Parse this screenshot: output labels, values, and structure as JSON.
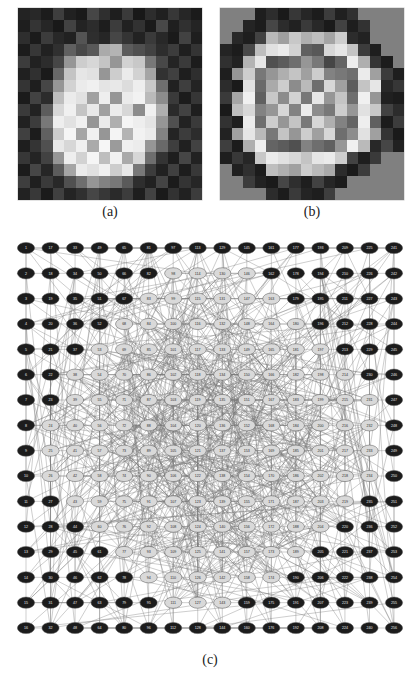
{
  "figure": {
    "panel_a": {
      "caption": "(a)",
      "description": "grayscale pixel map of a solid disk"
    },
    "panel_b": {
      "caption": "(b)",
      "description": "grayscale pixel map of an annulus / ring"
    },
    "panel_c": {
      "caption": "(c)",
      "description": "network graph of 256 nodes on a 16x16 lattice with highlighted boundary community"
    }
  },
  "colors": {
    "background": "#ffffff",
    "node_light_fill": "#d9d9d9",
    "node_dark_fill": "#1c1c1c",
    "node_stroke": "#555555",
    "edge": "#7a7a7a",
    "label_light": "#2a2a2a",
    "label_dark": "#e8e8e8",
    "heatmap_border": "#808080"
  },
  "chart_data": [
    {
      "type": "heatmap",
      "title": "(a)",
      "rows": 16,
      "cols": 16,
      "vmin": 0,
      "vmax": 255,
      "colormap": "gray",
      "xlabel": "",
      "ylabel": "",
      "grid": false,
      "values": [
        [
          35,
          40,
          28,
          62,
          33,
          26,
          70,
          47,
          30,
          58,
          24,
          45,
          32,
          55,
          38,
          27
        ],
        [
          30,
          52,
          38,
          25,
          66,
          35,
          44,
          29,
          60,
          33,
          50,
          26,
          72,
          31,
          48,
          36
        ],
        [
          46,
          27,
          60,
          40,
          33,
          84,
          46,
          38,
          70,
          52,
          34,
          58,
          40,
          26,
          66,
          30
        ],
        [
          28,
          55,
          33,
          48,
          96,
          72,
          88,
          170,
          180,
          92,
          80,
          66,
          45,
          60,
          31,
          52
        ],
        [
          60,
          33,
          44,
          70,
          150,
          205,
          215,
          196,
          150,
          210,
          200,
          120,
          72,
          36,
          58,
          28
        ],
        [
          32,
          48,
          26,
          104,
          196,
          230,
          225,
          150,
          205,
          235,
          210,
          165,
          50,
          64,
          30,
          46
        ],
        [
          52,
          30,
          70,
          150,
          210,
          235,
          240,
          228,
          232,
          220,
          238,
          200,
          110,
          33,
          62,
          35
        ],
        [
          27,
          66,
          44,
          190,
          235,
          225,
          160,
          238,
          150,
          235,
          242,
          186,
          140,
          58,
          28,
          54
        ],
        [
          58,
          34,
          92,
          215,
          240,
          196,
          232,
          160,
          236,
          215,
          140,
          240,
          175,
          42,
          66,
          30
        ],
        [
          33,
          60,
          120,
          238,
          225,
          240,
          150,
          235,
          175,
          245,
          238,
          228,
          150,
          80,
          34,
          58
        ],
        [
          64,
          28,
          96,
          205,
          245,
          165,
          240,
          150,
          244,
          180,
          242,
          235,
          130,
          36,
          60,
          44
        ],
        [
          30,
          52,
          80,
          232,
          215,
          240,
          170,
          246,
          155,
          240,
          236,
          150,
          105,
          62,
          32,
          66
        ],
        [
          55,
          36,
          66,
          150,
          238,
          210,
          245,
          190,
          242,
          170,
          215,
          110,
          52,
          30,
          70,
          34
        ],
        [
          28,
          70,
          38,
          92,
          165,
          235,
          225,
          240,
          205,
          232,
          120,
          60,
          33,
          64,
          29,
          56
        ],
        [
          62,
          31,
          58,
          40,
          80,
          110,
          150,
          130,
          120,
          90,
          46,
          33,
          68,
          27,
          52,
          38
        ],
        [
          34,
          56,
          27,
          64,
          36,
          48,
          70,
          55,
          42,
          60,
          30,
          66,
          26,
          50,
          33,
          60
        ]
      ]
    },
    {
      "type": "heatmap",
      "title": "(b)",
      "rows": 16,
      "cols": 16,
      "vmin": 0,
      "vmax": 255,
      "colormap": "gray",
      "xlabel": "",
      "ylabel": "",
      "grid": false,
      "values": [
        [
          128,
          128,
          128,
          30,
          45,
          26,
          55,
          38,
          28,
          60,
          32,
          48,
          128,
          128,
          128,
          128
        ],
        [
          128,
          128,
          36,
          28,
          70,
          44,
          33,
          58,
          40,
          26,
          66,
          30,
          50,
          128,
          128,
          128
        ],
        [
          128,
          40,
          30,
          66,
          185,
          160,
          200,
          175,
          190,
          165,
          205,
          44,
          34,
          128,
          128,
          128
        ],
        [
          36,
          28,
          72,
          190,
          225,
          235,
          210,
          96,
          88,
          215,
          230,
          196,
          60,
          30,
          128,
          128
        ],
        [
          48,
          34,
          180,
          230,
          80,
          92,
          110,
          150,
          120,
          70,
          100,
          238,
          175,
          52,
          28,
          128
        ],
        [
          30,
          150,
          205,
          120,
          150,
          175,
          196,
          160,
          205,
          130,
          120,
          110,
          235,
          160,
          60,
          30
        ],
        [
          44,
          26,
          225,
          106,
          170,
          205,
          140,
          186,
          110,
          215,
          160,
          92,
          196,
          230,
          40,
          55
        ],
        [
          58,
          165,
          240,
          96,
          200,
          140,
          210,
          120,
          230,
          150,
          196,
          110,
          240,
          150,
          32,
          28
        ],
        [
          26,
          190,
          215,
          130,
          150,
          215,
          130,
          235,
          140,
          120,
          205,
          150,
          225,
          200,
          66,
          44
        ],
        [
          50,
          30,
          235,
          110,
          205,
          150,
          196,
          120,
          215,
          175,
          130,
          100,
          238,
          96,
          28,
          60
        ],
        [
          34,
          160,
          230,
          186,
          120,
          196,
          150,
          205,
          160,
          215,
          110,
          140,
          225,
          160,
          52,
          26
        ],
        [
          62,
          28,
          175,
          238,
          100,
          92,
          80,
          130,
          110,
          96,
          150,
          240,
          186,
          40,
          70,
          33
        ],
        [
          30,
          56,
          38,
          200,
          235,
          225,
          215,
          196,
          230,
          235,
          205,
          66,
          30,
          58,
          128,
          128
        ],
        [
          128,
          32,
          48,
          28,
          190,
          175,
          160,
          205,
          186,
          170,
          44,
          26,
          60,
          128,
          128,
          128
        ],
        [
          128,
          128,
          60,
          34,
          26,
          70,
          46,
          30,
          66,
          38,
          28,
          128,
          128,
          128,
          128,
          128
        ],
        [
          128,
          128,
          128,
          128,
          44,
          28,
          58,
          36,
          30,
          62,
          128,
          128,
          128,
          128,
          128,
          128
        ]
      ]
    },
    {
      "type": "scatter",
      "title": "(c)",
      "layout": "16x16 lattice",
      "node_count": 256,
      "xlabel": "",
      "ylabel": "",
      "grid": false,
      "legend": [
        {
          "label": "boundary / ring community",
          "color": "#1c1c1c"
        },
        {
          "label": "interior community",
          "color": "#d9d9d9"
        }
      ],
      "dark_node_ids": [
        4,
        5,
        6,
        7,
        8,
        9,
        10,
        11,
        12,
        13,
        20,
        21,
        34,
        35,
        18,
        19,
        49,
        50,
        65,
        66,
        81,
        82,
        97,
        98,
        113,
        114,
        129,
        130,
        145,
        146,
        161,
        162,
        177,
        178,
        193,
        194,
        210,
        211,
        226,
        227,
        243,
        244,
        245,
        246,
        247,
        248,
        249,
        250,
        251,
        252,
        42,
        43,
        58,
        59,
        28,
        29,
        44,
        45,
        212,
        213,
        228,
        229,
        196,
        197,
        180,
        181,
        164,
        165,
        148,
        149,
        132,
        133,
        116,
        117,
        100,
        101,
        84,
        85,
        68,
        69,
        52,
        53,
        36,
        37
      ],
      "node_labels_sample": [
        "1",
        "17",
        "33",
        "49",
        "65",
        "81",
        "97",
        "113",
        "129",
        "145",
        "161",
        "177",
        "193",
        "209",
        "225",
        "241",
        "2",
        "18",
        "34",
        "16",
        "32",
        "48",
        "64",
        "80",
        "96",
        "112",
        "128",
        "144",
        "160",
        "176",
        "192",
        "208",
        "224",
        "240",
        "256"
      ]
    }
  ],
  "panel_c": {
    "rows": 16,
    "cols": 16,
    "node_rx": 8.6,
    "node_ry": 5.6
  }
}
